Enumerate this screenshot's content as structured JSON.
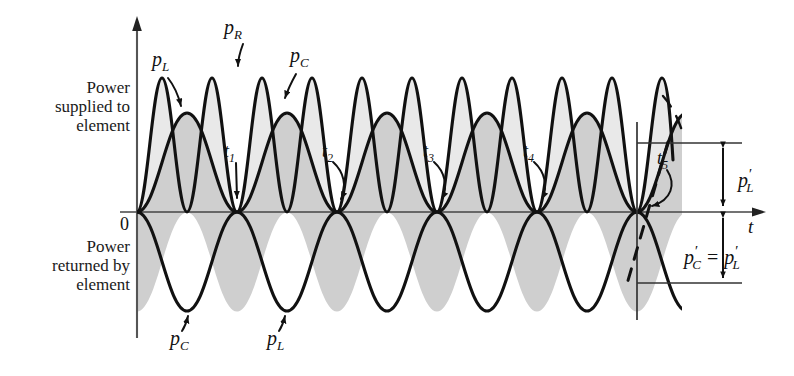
{
  "figure": {
    "axis": {
      "y_axis_name": "power",
      "x_axis_label": "t",
      "origin_label": "0",
      "origin_px": [
        137,
        212
      ]
    },
    "region_labels": {
      "upper": "Power\nsupplied to\nelement",
      "upper_line1": "Power",
      "upper_line2": "supplied to",
      "upper_line3": "element",
      "lower_line1": "Power",
      "lower_line2": "returned by",
      "lower_line3": "element"
    },
    "curve_labels": [
      {
        "id": "pL-top",
        "base": "p",
        "sub": "L",
        "prime": "",
        "x": 157,
        "y": 62,
        "arrow_to": [
          181,
          110
        ]
      },
      {
        "id": "pR-top",
        "base": "p",
        "sub": "R",
        "prime": "",
        "x": 228,
        "y": 27,
        "arrow_to": [
          239,
          73
        ]
      },
      {
        "id": "pC-top",
        "base": "p",
        "sub": "C",
        "prime": "",
        "x": 292,
        "y": 58,
        "arrow_to": [
          283,
          103
        ]
      },
      {
        "id": "pC-bot",
        "base": "p",
        "sub": "C",
        "prime": "",
        "x": 176,
        "y": 338,
        "arrow_to": [
          188,
          310
        ]
      },
      {
        "id": "pL-bot",
        "base": "p",
        "sub": "L",
        "prime": "",
        "x": 272,
        "y": 338,
        "arrow_to": [
          285,
          310
        ]
      }
    ],
    "time_markers": [
      {
        "label": "t",
        "sub": "1",
        "x": 228,
        "y": 146,
        "tip": [
          237,
          205
        ]
      },
      {
        "label": "t",
        "sub": "2",
        "x": 326,
        "y": 146,
        "tip": [
          337,
          205
        ]
      },
      {
        "label": "t",
        "sub": "3",
        "x": 428,
        "y": 146,
        "tip": [
          437,
          205
        ]
      },
      {
        "label": "t",
        "sub": "4",
        "x": 527,
        "y": 146,
        "tip": [
          537,
          205
        ]
      },
      {
        "label": "t",
        "sub": "5",
        "x": 661,
        "y": 155,
        "tip": [
          642,
          208
        ]
      }
    ],
    "dimension_labels": [
      {
        "id": "pL-prime",
        "text_base": "p",
        "sub": "L",
        "prime": "′",
        "x": 741,
        "y": 178
      },
      {
        "id": "pC-prime-eq",
        "base_c": "p",
        "sub_c": "C",
        "prime_c": "′",
        "equals": "=",
        "base_l": "p",
        "sub_l": "L",
        "prime_l": "′",
        "x": 688,
        "y": 254
      }
    ],
    "curves": {
      "p_R": {
        "name": "p_R",
        "amplitude": 134,
        "half_period_px": 100,
        "description": "resistor power, always positive, double frequency"
      },
      "p_L": {
        "name": "p_L",
        "amplitude": 99,
        "half_period_px": 100,
        "description": "inductor power, alternates sign"
      },
      "p_C": {
        "name": "p_C",
        "amplitude": 99,
        "half_period_px": 100,
        "description": "capacitor power, inverted relative to p_L"
      }
    },
    "zero_crossings_px": [
      137,
      237,
      337,
      437,
      537,
      637
    ],
    "reference_lines": {
      "upper_y": 143,
      "lower_y": 283,
      "vertical_x": 637,
      "dim_arrow_x": 723
    },
    "colors": {
      "ink": "#111111",
      "shade_light": "#e9e9e9",
      "shade_mid": "#cfcfcf",
      "shade_dark": "#c2c2c2",
      "background": "#ffffff"
    }
  }
}
